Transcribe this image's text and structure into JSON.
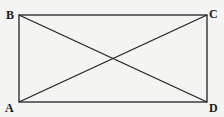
{
  "diagram": {
    "type": "rectangle-with-diagonals",
    "vertices": {
      "A": {
        "label": "A",
        "x": 19,
        "y": 102
      },
      "B": {
        "label": "B",
        "x": 19,
        "y": 15
      },
      "C": {
        "label": "C",
        "x": 207,
        "y": 15
      },
      "D": {
        "label": "D",
        "x": 207,
        "y": 102
      }
    },
    "edges": [
      "AB",
      "BC",
      "CD",
      "DA"
    ],
    "diagonals": [
      "AC",
      "BD"
    ],
    "stroke_color": "#222222",
    "background": "#f4f4f2"
  }
}
